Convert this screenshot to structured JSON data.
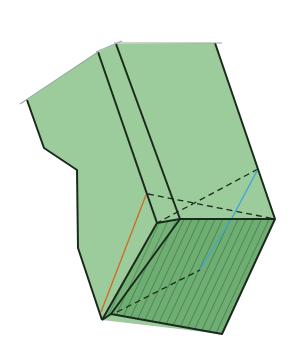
{
  "diagram": {
    "title": "",
    "colors": {
      "face_fill": "#9ccc9b",
      "hatched_face_fill": "#6fae72",
      "hatch_line": "#2f5f36",
      "edge": "#1a2a1c",
      "orange_line": "#d2691e",
      "blue_line": "#3fa7d6",
      "tick": "#9aa7a0"
    },
    "elements": [
      {
        "id": "outer-surface",
        "kind": "face"
      },
      {
        "id": "bottom-hatched-face",
        "kind": "face",
        "style": "hatched"
      },
      {
        "id": "hidden-edges",
        "kind": "edges",
        "style": "dashed"
      },
      {
        "id": "orange-diagonal",
        "kind": "line",
        "color": "orange"
      },
      {
        "id": "blue-diagonal",
        "kind": "line",
        "color": "blue"
      }
    ]
  }
}
